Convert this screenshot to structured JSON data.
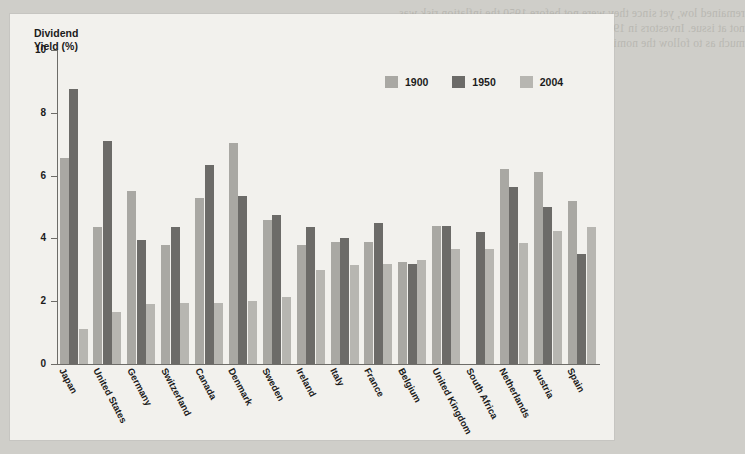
{
  "chart_data": {
    "type": "bar",
    "title": "",
    "ylabel": "Dividend\nYield (%)",
    "xlabel": "",
    "ylim": [
      0,
      10
    ],
    "yticks": [
      0,
      2,
      4,
      6,
      8,
      10
    ],
    "grid": false,
    "legend_position": "top-right",
    "categories": [
      "Japan",
      "United States",
      "Germany",
      "Switzerland",
      "Canada",
      "Denmark",
      "Sweden",
      "Ireland",
      "Italy",
      "France",
      "Belgium",
      "United Kingdom",
      "South Africa",
      "Netherlands",
      "Austria",
      "Spain"
    ],
    "series": [
      {
        "name": "1900",
        "color": "#a9a8a3",
        "values": [
          6.55,
          4.35,
          5.5,
          3.8,
          5.3,
          7.05,
          4.6,
          3.8,
          3.9,
          3.9,
          3.25,
          4.4,
          null,
          6.2,
          6.1,
          5.2
        ]
      },
      {
        "name": "1950",
        "color": "#6c6b68",
        "values": [
          8.75,
          7.1,
          3.95,
          4.35,
          6.35,
          5.35,
          4.75,
          4.35,
          4.0,
          4.5,
          3.2,
          4.4,
          4.2,
          5.65,
          5.0,
          3.5
        ]
      },
      {
        "name": "2004",
        "color": "#b7b6b1",
        "values": [
          1.1,
          1.65,
          1.9,
          1.95,
          1.95,
          2.0,
          2.15,
          3.0,
          3.15,
          3.2,
          3.3,
          3.65,
          3.65,
          3.85,
          4.25,
          4.35
        ]
      }
    ]
  },
  "legend": {
    "items": [
      {
        "label": "1900"
      },
      {
        "label": "1950"
      },
      {
        "label": "2004"
      }
    ]
  },
  "bleed_text": {
    "top": "remained low, yet since they were not before 1950 the inflation risk was\nnot at issue. Investors in 1950 were not aware that inflation would rise so\nmuch as to follow the nominal yields in a short term. There were fundamental changes",
    "mid": "in the years that followed, and the stock",
    "low": "market has been transformed in that\nperiod, but dividend payout ratios have\nfallen substantially and firms now return\ncash to shareholders through share repurchases.",
    "bottom": "yields as a simple measure of their attractiveness"
  }
}
